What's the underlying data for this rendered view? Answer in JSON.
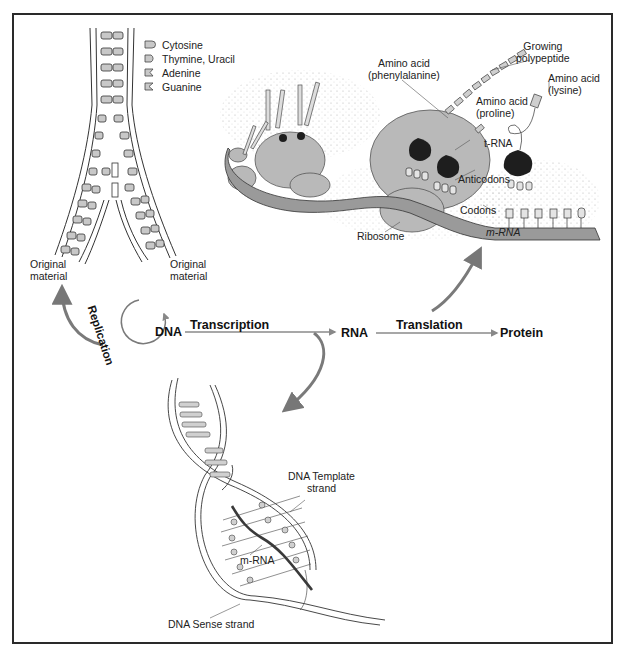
{
  "diagram": {
    "legend": {
      "items": [
        {
          "label": "Cytosine",
          "glyph": "cytosine-block"
        },
        {
          "label": "Thymine, Uracil",
          "glyph": "thymine-uracil-block"
        },
        {
          "label": "Adenine",
          "glyph": "adenine-notch"
        },
        {
          "label": "Guanine",
          "glyph": "guanine-notch"
        }
      ]
    },
    "replication_fork": {
      "left_label_line1": "Original",
      "left_label_line2": "material",
      "right_label_line1": "Original",
      "right_label_line2": "material"
    },
    "flow": {
      "replication": "Replication",
      "dna": "DNA",
      "transcription": "Transcription",
      "rna": "RNA",
      "translation": "Translation",
      "protein": "Protein"
    },
    "translation_panel": {
      "growing_polypeptide_line1": "Growing",
      "growing_polypeptide_line2": "polypeptide",
      "amino_phenylalanine_line1": "Amino acid",
      "amino_phenylalanine_line2": "(phenylalanine)",
      "amino_proline_line1": "Amino acid",
      "amino_proline_line2": "(proline)",
      "amino_lysine_line1": "Amino acid",
      "amino_lysine_line2": "(lysine)",
      "trna": "t-RNA",
      "anticodons": "Anticodons",
      "codons": "Codons",
      "ribosome": "Ribosome",
      "mrna": "m-RNA",
      "codon_letters": [
        "A",
        "A",
        "G"
      ],
      "anticodon_letters": [
        "U",
        "U",
        "C"
      ]
    },
    "transcription_panel": {
      "template_line1": "DNA Template",
      "template_line2": "strand",
      "mrna": "m-RNA",
      "sense": "DNA Sense strand"
    },
    "colors": {
      "frame": "#2a2a2a",
      "ribosome_fill": "#b9b9b9",
      "trna_body": "#1e1e1e",
      "mrna_band": "#9a9a9a",
      "arrow": "#7a7a7a",
      "base_fill": "#c8c8c8"
    }
  }
}
